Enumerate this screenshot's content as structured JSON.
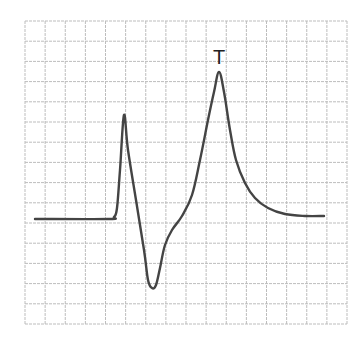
{
  "chart_data": {
    "type": "line",
    "title": "",
    "xlabel": "",
    "ylabel": "",
    "grid": true,
    "grid_cols": 16,
    "grid_rows": 15,
    "annotations": [
      {
        "text": "T",
        "x": 219,
        "y": 57
      }
    ],
    "colors": {
      "grid": "#bdbdbd",
      "trace": "#444444",
      "label": "#222222"
    },
    "trace_points_px": [
      [
        35,
        219
      ],
      [
        108,
        219
      ],
      [
        114,
        217
      ],
      [
        117,
        208
      ],
      [
        120,
        170
      ],
      [
        124,
        115
      ],
      [
        128,
        150
      ],
      [
        136,
        200
      ],
      [
        144,
        250
      ],
      [
        148,
        280
      ],
      [
        152,
        288
      ],
      [
        156,
        285
      ],
      [
        160,
        268
      ],
      [
        165,
        245
      ],
      [
        172,
        230
      ],
      [
        182,
        216
      ],
      [
        192,
        195
      ],
      [
        200,
        160
      ],
      [
        208,
        120
      ],
      [
        214,
        92
      ],
      [
        219,
        72
      ],
      [
        224,
        92
      ],
      [
        230,
        130
      ],
      [
        236,
        160
      ],
      [
        245,
        183
      ],
      [
        255,
        198
      ],
      [
        268,
        208
      ],
      [
        285,
        214
      ],
      [
        305,
        216
      ],
      [
        324,
        216
      ]
    ]
  },
  "figure": {
    "peak_label": "T"
  }
}
